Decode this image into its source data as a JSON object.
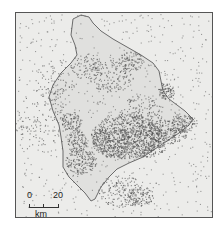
{
  "map": {
    "subject": "Island of Hawaii seismicity (earthquake epicenters)",
    "colors": {
      "background": "#ececea",
      "island_fill": "#e0e0de",
      "coastline": "#6b6b6b",
      "epicenter": "#555555",
      "frame": "#555555"
    },
    "scale_bar": {
      "start_label": "0",
      "end_label": "20",
      "unit_label": "km"
    }
  }
}
